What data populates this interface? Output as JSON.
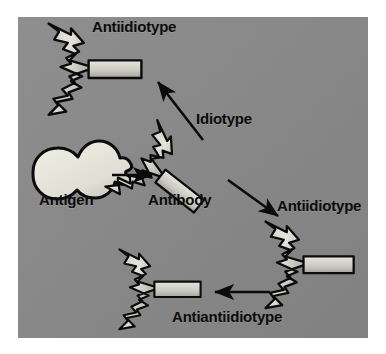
{
  "figure": {
    "background_color": "#8a8a8a",
    "outline_color": "#0b0b0b",
    "shape_fill_light": "#dcdcd4",
    "shape_fill_mid": "#b8b8b2",
    "page_background": "#ffffff"
  },
  "labels": {
    "antiidiotype_top": "Antiidiotype",
    "idiotype": "Idiotype",
    "antigen": "Antigen",
    "antibody": "Antibody",
    "antiidiotype_right": "Antiidiotype",
    "antiantiidiotype": "Antiantiidiotype"
  },
  "elements": [
    {
      "name": "antigen-shape",
      "type": "blob",
      "label": "Antigen"
    },
    {
      "name": "antibody-shape",
      "type": "y-antibody",
      "label": "Antibody",
      "rotation_deg": -35
    },
    {
      "name": "antiidiotype-top-shape",
      "type": "y-antibody",
      "label": "Antiidiotype",
      "rotation_deg": 0
    },
    {
      "name": "antiidiotype-right-shape",
      "type": "y-antibody",
      "label": "Antiidiotype",
      "rotation_deg": 0
    },
    {
      "name": "antiantiidiotype-shape",
      "type": "y-antibody",
      "label": "Antiantiidiotype",
      "rotation_deg": 0
    }
  ],
  "arrows": [
    {
      "name": "arrow-antigen-to-antibody",
      "from": "Antigen",
      "to": "Antibody",
      "direction": "right"
    },
    {
      "name": "arrow-antibody-to-antiidiotype-top",
      "from": "Antibody",
      "to": "Antiidiotype",
      "direction": "up-left"
    },
    {
      "name": "arrow-antibody-to-antiidiotype-right",
      "from": "Antibody",
      "to": "Antiidiotype",
      "direction": "down-right"
    },
    {
      "name": "arrow-antiidiotype-to-antiantiidiotype",
      "from": "Antiidiotype",
      "to": "Antiantiidiotype",
      "direction": "left"
    }
  ]
}
